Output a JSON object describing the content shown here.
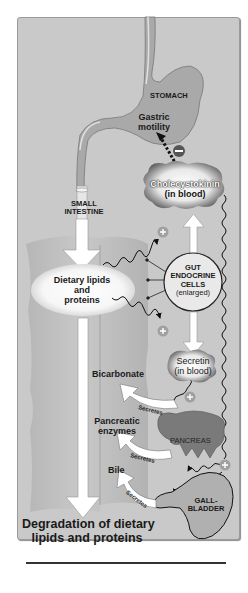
{
  "figure": {
    "domain": "physiology-diagram",
    "colors": {
      "panel_bg": "#c9c9c9",
      "organ_fill": "#a7a7a7",
      "organ_dark": "#6e6e6e",
      "arrow_fill": "#ffffff",
      "plus_badge": "#a0a0a0",
      "minus_badge": "#555555",
      "text": "#1a1a1a"
    },
    "labels": {
      "stomach": "STOMACH",
      "gastric_motility_1": "Gastric",
      "gastric_motility_2": "motility",
      "cholecystokinin_1": "Cholecystokinin",
      "cholecystokinin_2": "(in blood)",
      "small_intestine_1": "SMALL",
      "small_intestine_2": "INTESTINE",
      "dietary_1": "Dietary lipids",
      "dietary_2": "and",
      "dietary_3": "proteins",
      "gut_1": "GUT",
      "gut_2": "ENDOCRINE",
      "gut_3": "CELLS",
      "gut_4": "(enlarged)",
      "secretin_1": "Secretin",
      "secretin_2": "(in blood)",
      "bicarbonate": "Bicarbonate",
      "pancreatic_1": "Pancreatic",
      "pancreatic_2": "enzymes",
      "pancreas": "PANCREAS",
      "bile": "Bile",
      "gallbladder_1": "GALL-",
      "gallbladder_2": "BLADDER",
      "secretes": "Secretes",
      "degradation_1": "Degradation of dietary",
      "degradation_2": "lipids and proteins"
    },
    "signs": {
      "inhibit": "−",
      "stimulate": "+"
    }
  }
}
